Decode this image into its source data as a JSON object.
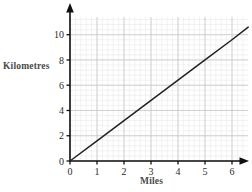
{
  "chart_data": {
    "type": "line",
    "title": "",
    "subtitle": "",
    "xlabel": "Miles",
    "ylabel": "Kilometres",
    "xlim": [
      0,
      6.6
    ],
    "ylim": [
      0,
      11.4
    ],
    "xticks": [
      0,
      1,
      2,
      3,
      4,
      5,
      6
    ],
    "xtick_labels": [
      "0",
      "1",
      "2",
      "3",
      "4",
      "5",
      "6"
    ],
    "yticks": [
      0,
      2,
      4,
      6,
      8,
      10
    ],
    "ytick_labels": [
      "0",
      "2",
      "4",
      "6",
      "8",
      "10"
    ],
    "grid": true,
    "grid_major_step_x": 1,
    "grid_major_step_y": 2,
    "grid_minor_step_x": 0.2,
    "grid_minor_step_y": 0.4,
    "legend": null,
    "legend_position": "none",
    "annotations": [],
    "series": [
      {
        "name": "Miles to kilometres conversion",
        "slope": 1.6,
        "intercept": 0,
        "x": [
          0,
          1,
          2,
          3,
          4,
          5,
          6,
          6.6
        ],
        "values": [
          0,
          1.6,
          3.2,
          4.8,
          6.4,
          8.0,
          9.6,
          10.6
        ],
        "color": "#222222"
      }
    ],
    "axis_arrows": {
      "x_axis_arrow": true,
      "y_axis_arrow": true
    },
    "colors": {
      "line": "#222222",
      "axis": "#111111",
      "grid_major": "#c8c8c8",
      "grid_minor": "#ececec",
      "tick_label": "#2b2b2b",
      "axis_title": "#4a4a4a",
      "background": "#ffffff"
    }
  },
  "labels": {
    "y_axis_title": "Kilometres",
    "x_axis_title": "Miles"
  }
}
